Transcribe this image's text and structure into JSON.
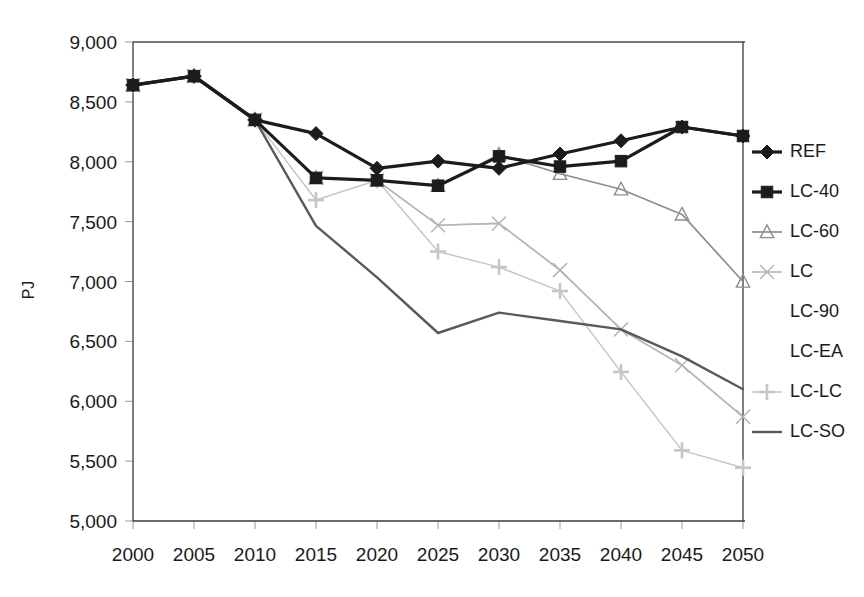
{
  "chart_data": {
    "type": "line",
    "title": "",
    "subtitle": "",
    "xlabel": "",
    "ylabel": "PJ",
    "x": [
      2000,
      2005,
      2010,
      2015,
      2020,
      2025,
      2030,
      2035,
      2040,
      2045,
      2050
    ],
    "xtick_labels": [
      "2000",
      "2005",
      "2010",
      "2015",
      "2020",
      "2025",
      "2030",
      "2035",
      "2040",
      "2045",
      "2050"
    ],
    "ytick_labels": [
      "9,000",
      "8,500",
      "8,000",
      "7,500",
      "7,000",
      "6,500",
      "6,000",
      "5,500",
      "5,000"
    ],
    "yticks": [
      9000,
      8500,
      8000,
      7500,
      7000,
      6500,
      6000,
      5500,
      5000
    ],
    "xlim": [
      2000,
      2050
    ],
    "ylim": [
      5000,
      9000
    ],
    "grid": false,
    "legend_position": "right",
    "series": [
      {
        "name": "REF",
        "marker": "diamond",
        "color": "#1c1c1c",
        "line_width": 3.2,
        "marker_size": 7,
        "dash": "none",
        "values": [
          8640,
          8715,
          8350,
          8235,
          7945,
          8005,
          7945,
          8065,
          8175,
          8290,
          8215
        ]
      },
      {
        "name": "LC-40",
        "marker": "square",
        "color": "#1c1c1c",
        "line_width": 3.2,
        "marker_size": 7,
        "dash": "none",
        "values": [
          8640,
          8715,
          8350,
          7865,
          7845,
          7800,
          8045,
          7960,
          8005,
          8290,
          8215
        ]
      },
      {
        "name": "LC-60",
        "marker": "triangle",
        "color": "#8d8d8d",
        "line_width": 1.7,
        "marker_size": 7,
        "dash": "none",
        "values": [
          8640,
          8715,
          8350,
          7865,
          7845,
          7800,
          8060,
          7900,
          7770,
          7560,
          7000
        ]
      },
      {
        "name": "LC",
        "marker": "x",
        "color": "#b4b4b4",
        "line_width": 1.6,
        "marker_size": 7,
        "dash": "none",
        "values": [
          8640,
          8715,
          8350,
          7865,
          7845,
          7470,
          7485,
          7095,
          6600,
          6300,
          5870
        ]
      },
      {
        "name": "LC-90",
        "marker": "none",
        "color": "#d8d8d8",
        "line_width": 1.4,
        "marker_size": 0,
        "dash": "none",
        "values": [
          8640,
          8715,
          8350,
          7865,
          7845,
          7470,
          7485,
          7095,
          6600,
          6300,
          5870
        ]
      },
      {
        "name": "LC-EA",
        "marker": "none",
        "color": "#e2e2e2",
        "line_width": 1.3,
        "marker_size": 0,
        "dash": "none",
        "values": [
          8640,
          8715,
          8350,
          7865,
          7845,
          7470,
          7485,
          7095,
          6600,
          6300,
          5870
        ]
      },
      {
        "name": "LC-LC",
        "marker": "plus",
        "color": "#c6c6c6",
        "line_width": 1.5,
        "marker_size": 8,
        "dash": "none",
        "values": [
          8640,
          8715,
          8350,
          7680,
          7845,
          7250,
          7120,
          6920,
          6245,
          5590,
          5445
        ]
      },
      {
        "name": "LC-SO",
        "marker": "none",
        "color": "#5a5a5a",
        "line_width": 2.4,
        "marker_size": 0,
        "dash": "none",
        "values": [
          8640,
          8715,
          8350,
          7465,
          7035,
          6570,
          6740,
          6670,
          6600,
          6375,
          6100
        ]
      }
    ]
  },
  "legend": {
    "entries": [
      {
        "label": "REF"
      },
      {
        "label": "LC-40"
      },
      {
        "label": "LC-60"
      },
      {
        "label": "LC"
      },
      {
        "label": "LC-90"
      },
      {
        "label": "LC-EA"
      },
      {
        "label": "LC-LC"
      },
      {
        "label": "LC-SO"
      }
    ]
  },
  "axis": {
    "y_title": "PJ"
  }
}
